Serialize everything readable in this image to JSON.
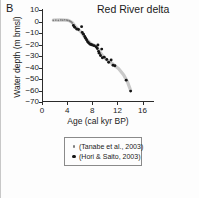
{
  "panel": {
    "label": "B"
  },
  "chart_data": {
    "type": "scatter",
    "title": "Red River delta",
    "xlabel": "Age (cal kyr BP)",
    "ylabel": "Water depth (m bmsl)",
    "xlim": [
      0,
      17.5
    ],
    "ylim": [
      -70,
      10
    ],
    "xticks": [
      0,
      4,
      8,
      12,
      16
    ],
    "xticklabels": [
      "0",
      "4",
      "8",
      "12",
      "16"
    ],
    "yticks": [
      10,
      0,
      -10,
      -20,
      -30,
      -40,
      -50,
      -60,
      -70
    ],
    "yticklabels": [
      "10",
      "0",
      "−10",
      "−20",
      "−30",
      "−40",
      "−50",
      "−60",
      "−70"
    ],
    "grid": false,
    "legend_position": "below-axes",
    "series": [
      {
        "name": "(Tanabe et al., 2003)",
        "marker": "small-gray-dot",
        "color": "#7d7d7d",
        "points": [
          [
            1.8,
            1.0
          ],
          [
            2.2,
            1.2
          ],
          [
            2.6,
            1.0
          ],
          [
            3.0,
            1.4
          ],
          [
            3.3,
            1.2
          ],
          [
            3.6,
            1.5
          ],
          [
            3.9,
            1.3
          ],
          [
            4.1,
            1.0
          ],
          [
            4.35,
            0.6
          ],
          [
            4.5,
            0.2
          ],
          [
            4.65,
            -0.4
          ],
          [
            4.8,
            -1.2
          ]
        ]
      },
      {
        "name": "(Hori & Saito, 2003)",
        "marker": "black-dot",
        "color": "#141414",
        "points": [
          [
            5.0,
            -3.5
          ],
          [
            5.2,
            -5.0
          ],
          [
            5.5,
            -6.5
          ],
          [
            5.8,
            -7.0
          ],
          [
            6.3,
            -4.5
          ],
          [
            6.4,
            -9.5
          ],
          [
            6.6,
            -11.0
          ],
          [
            6.8,
            -13.0
          ],
          [
            6.95,
            -14.5
          ],
          [
            7.1,
            -16.0
          ],
          [
            7.25,
            -17.5
          ],
          [
            7.4,
            -18.5
          ],
          [
            7.6,
            -19.5
          ],
          [
            7.8,
            -20.0
          ],
          [
            8.0,
            -20.5
          ],
          [
            8.3,
            -21.0
          ],
          [
            8.6,
            -22.0
          ],
          [
            8.8,
            -23.5
          ],
          [
            8.9,
            -20.5
          ],
          [
            9.0,
            -26.0
          ],
          [
            9.1,
            -27.5
          ],
          [
            9.3,
            -29.5
          ],
          [
            9.5,
            -24.0
          ],
          [
            9.6,
            -31.5
          ],
          [
            9.9,
            -31.0
          ],
          [
            10.3,
            -33.0
          ],
          [
            10.6,
            -35.5
          ],
          [
            11.0,
            -33.5
          ],
          [
            11.3,
            -38.0
          ],
          [
            11.6,
            -38.5
          ],
          [
            13.4,
            -51.0
          ],
          [
            14.1,
            -60.5
          ]
        ]
      }
    ],
    "trend_band": {
      "description": "thick light-gray sea-level curve",
      "color": "#c9c9c9",
      "points": [
        [
          1.8,
          1.2
        ],
        [
          3.0,
          1.4
        ],
        [
          4.2,
          1.0
        ],
        [
          4.8,
          -0.8
        ],
        [
          5.4,
          -5.0
        ],
        [
          6.2,
          -9.0
        ],
        [
          7.0,
          -15.0
        ],
        [
          7.8,
          -19.5
        ],
        [
          8.6,
          -21.5
        ],
        [
          9.2,
          -26.5
        ],
        [
          9.8,
          -31.0
        ],
        [
          10.6,
          -34.5
        ],
        [
          11.4,
          -37.5
        ],
        [
          12.2,
          -41.0
        ],
        [
          13.0,
          -46.5
        ],
        [
          13.6,
          -52.5
        ],
        [
          14.1,
          -60.0
        ]
      ]
    }
  },
  "legend": {
    "entries": [
      {
        "label": "(Tanabe et al., 2003)",
        "marker": "small-gray-dot"
      },
      {
        "label": "(Hori & Saito, 2003)",
        "marker": "black-dot"
      }
    ]
  }
}
